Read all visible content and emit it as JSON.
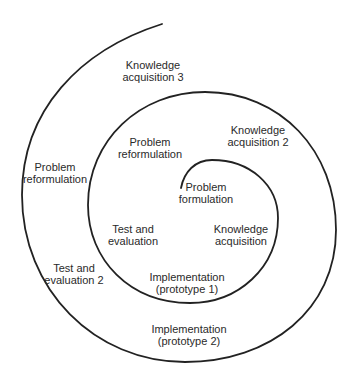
{
  "diagram": {
    "type": "spiral",
    "line_color": "#222222",
    "labels": [
      {
        "id": "problem-formulation",
        "lines": [
          "Problem",
          "formulation"
        ],
        "x": 206,
        "y": 181
      },
      {
        "id": "knowledge-acquisition",
        "lines": [
          "Knowledge",
          "acquisition"
        ],
        "x": 241,
        "y": 223
      },
      {
        "id": "implementation-prototype-1",
        "lines": [
          "Implementation",
          "(prototype 1)"
        ],
        "x": 187,
        "y": 271
      },
      {
        "id": "test-and-evaluation",
        "lines": [
          "Test and",
          "evaluation"
        ],
        "x": 133,
        "y": 223
      },
      {
        "id": "problem-reformulation-1",
        "lines": [
          "Problem",
          "reformulation"
        ],
        "x": 150,
        "y": 136
      },
      {
        "id": "knowledge-acquisition-2",
        "lines": [
          "Knowledge",
          "acquisition 2"
        ],
        "x": 258,
        "y": 124
      },
      {
        "id": "implementation-prototype-2",
        "lines": [
          "Implementation",
          "(prototype 2)"
        ],
        "x": 189,
        "y": 323
      },
      {
        "id": "test-and-evaluation-2",
        "lines": [
          "Test and",
          "evaluation 2"
        ],
        "x": 74,
        "y": 262
      },
      {
        "id": "problem-reformulation-2",
        "lines": [
          "Problem",
          "reformulation"
        ],
        "x": 55,
        "y": 161
      },
      {
        "id": "knowledge-acquisition-3",
        "lines": [
          "Knowledge",
          "acquisition 3"
        ],
        "x": 153,
        "y": 59
      }
    ]
  }
}
